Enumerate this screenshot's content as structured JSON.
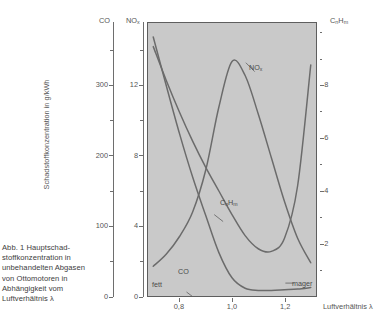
{
  "caption": "Abb. 1 Hauptschad-stoffkonzentration in unbehandelten Abgasen von Ottomotoren in Abhängigkeit vom Luftverhältnis λ",
  "axis_titles": {
    "y_main": "Schadstoffkonzentration in g/kWh",
    "x": "Luftverhältnis λ",
    "co_head": "CO",
    "nox_head": "NO",
    "nox_head_sub": "x",
    "cnhm_head": "C",
    "cnhm_head_sub1": "n",
    "cnhm_head_mid": "H",
    "cnhm_head_sub2": "m"
  },
  "annotations": {
    "fett": "fett",
    "mager": "mager",
    "nox": "NO",
    "nox_sub": "x",
    "cnhm": "C",
    "cnhm_sub1": "n",
    "cnhm_mid": "H",
    "cnhm_sub2": "m",
    "co": "CO"
  },
  "colors": {
    "plot_background": "#c9c9c9",
    "frame": "#5e5e5e",
    "curve": "#6b6b6b",
    "text": "#4a4a4a"
  },
  "chart_data": {
    "type": "line",
    "xlabel": "Luftverhältnis λ",
    "ylabel": "Schadstoffkonzentration in g/kWh",
    "grid": false,
    "legend": "inline-labels",
    "x": [
      0.7,
      0.75,
      0.8,
      0.85,
      0.9,
      0.95,
      1.0,
      1.05,
      1.1,
      1.15,
      1.2,
      1.25,
      1.3
    ],
    "xlim": [
      0.68,
      1.32
    ],
    "xticks": [
      "0,8",
      "1,0",
      "1,2"
    ],
    "xtick_values": [
      0.8,
      1.0,
      1.2
    ],
    "axes": [
      {
        "name": "CO",
        "label": "CO",
        "unit": "g/kWh",
        "side": "left-outer",
        "ylim": [
          0,
          390
        ],
        "ticks": [
          0,
          100,
          200,
          300
        ],
        "ticklabels": [
          "0",
          "100",
          "200",
          "300"
        ],
        "minor_ticks": [
          50,
          150,
          250,
          350
        ]
      },
      {
        "name": "NOx",
        "label": "NOx",
        "unit": "g/kWh",
        "side": "left-inner",
        "ylim": [
          0,
          15.6
        ],
        "ticks": [
          0,
          4,
          8,
          12
        ],
        "ticklabels": [
          "0",
          "4",
          "8",
          "12"
        ],
        "minor_ticks": [
          2,
          6,
          10,
          14
        ]
      },
      {
        "name": "CnHm",
        "label": "CnHm",
        "unit": "g/kWh",
        "side": "right",
        "ylim": [
          0,
          10.4
        ],
        "ticks": [
          2,
          4,
          6,
          8
        ],
        "ticklabels": [
          "2",
          "4",
          "6",
          "8"
        ],
        "minor_ticks": [
          1,
          3,
          5,
          7,
          9,
          10
        ]
      }
    ],
    "series": [
      {
        "name": "CO",
        "axis": "CO",
        "label": "CO",
        "values": [
          370,
          300,
          232,
          170,
          115,
          62,
          26,
          11,
          8,
          8,
          9,
          10,
          12
        ]
      },
      {
        "name": "NOx",
        "axis": "NOx",
        "label": "NOx",
        "values": [
          1.7,
          2.4,
          3.4,
          4.8,
          7.2,
          10.8,
          13.4,
          12.6,
          10.4,
          7.9,
          5.4,
          3.3,
          1.9
        ]
      },
      {
        "name": "CnHm",
        "axis": "CnHm",
        "label": "CnHm",
        "values": [
          9.5,
          8.2,
          7.0,
          5.9,
          4.9,
          4.0,
          3.1,
          2.3,
          1.8,
          1.7,
          2.2,
          4.2,
          8.8
        ]
      }
    ],
    "annotations": [
      {
        "text": "fett",
        "position": "bottom-left",
        "meaning": "rich mixture"
      },
      {
        "text": "mager",
        "position": "bottom-right",
        "meaning": "lean mixture"
      }
    ]
  }
}
